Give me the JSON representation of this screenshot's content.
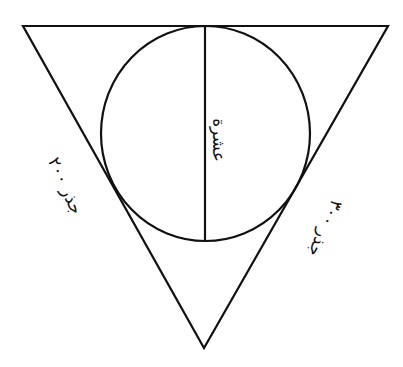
{
  "diagram": {
    "type": "geometry",
    "colors": {
      "stroke": "#111111",
      "background": "#ffffff"
    },
    "triangle": {
      "top_left": [
        23,
        26
      ],
      "top_right": [
        388,
        26
      ],
      "bottom": [
        204,
        348
      ]
    },
    "circle": {
      "cx": 205,
      "cy": 133,
      "r": 106
    },
    "diameter": {
      "x1": 205,
      "y1": 26,
      "x2": 205,
      "y2": 241
    },
    "labels": {
      "diameter": "عشرة",
      "left_side": "جذر ٢٠٠",
      "right_side": "جذر ٣٠٠"
    }
  }
}
